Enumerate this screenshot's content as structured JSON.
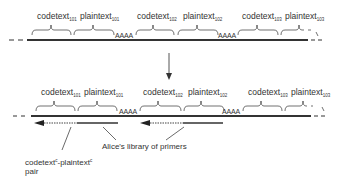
{
  "top_strand": {
    "segments": [
      {
        "label": "codetext",
        "subscript": "101"
      },
      {
        "label": "plaintext",
        "subscript": "101"
      },
      {
        "label": "codetext",
        "subscript": "102"
      },
      {
        "label": "plaintext",
        "subscript": "102"
      },
      {
        "label": "codetext",
        "subscript": "103"
      },
      {
        "label": "plaintext",
        "subscript": "103"
      }
    ],
    "spacers": [
      "AAAA",
      "AAAA"
    ]
  },
  "bottom_strand": {
    "segments": [
      {
        "label": "codetext",
        "subscript": "101"
      },
      {
        "label": "plaintext",
        "subscript": "101"
      },
      {
        "label": "codetext",
        "subscript": "102"
      },
      {
        "label": "plaintext",
        "subscript": "102"
      },
      {
        "label": "codetext",
        "subscript": "103"
      },
      {
        "label": "plaintext",
        "subscript": "103"
      }
    ],
    "spacers": [
      "AAAA",
      "AAAA"
    ]
  },
  "annotations": {
    "pair": {
      "prefix": "codetext",
      "sup1": "c",
      "mid": "-plaintext",
      "sup2": "c",
      "line2": "pair"
    },
    "primers": "Alice's library of primers"
  },
  "colors": {
    "line": "#333333",
    "text": "#333333"
  }
}
